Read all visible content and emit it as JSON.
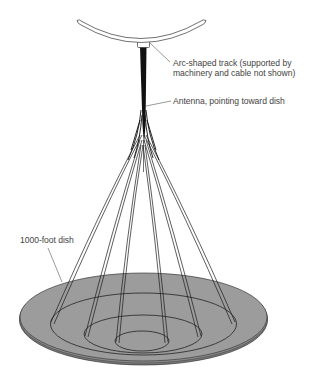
{
  "diagram": {
    "labels": {
      "track_line1": "Arc-shaped track (supported by",
      "track_line2": "machinery and cable not shown)",
      "antenna": "Antenna, pointing toward dish",
      "dish": "1000-foot dish"
    },
    "colors": {
      "dish_fill": "#9a9a9a",
      "dish_edge": "#6e6e6e",
      "line": "#1a1a1a",
      "text": "#444444",
      "background": "#ffffff"
    }
  }
}
